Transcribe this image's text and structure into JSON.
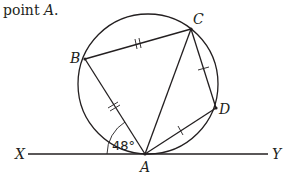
{
  "intro": {
    "prefix": "point ",
    "point": "A",
    "suffix": "."
  },
  "labels": {
    "B": "B",
    "C": "C",
    "D": "D",
    "A": "A",
    "X": "X",
    "Y": "Y"
  },
  "angle": {
    "value": "48°"
  },
  "colors": {
    "stroke": "#231f20",
    "background": "#ffffff"
  },
  "geometry": {
    "circle": {
      "cx": 148,
      "cy": 84,
      "r": 70
    },
    "points": {
      "A": [
        145,
        154
      ],
      "B": [
        85,
        59
      ],
      "C": [
        191,
        29
      ],
      "D": [
        216,
        108
      ]
    },
    "tangent": {
      "x1": 28,
      "x2": 268,
      "y": 154
    },
    "equal_marks": {
      "double_dash": [
        "AB",
        "BC"
      ],
      "single_dash": [
        "CD",
        "DA"
      ]
    }
  }
}
